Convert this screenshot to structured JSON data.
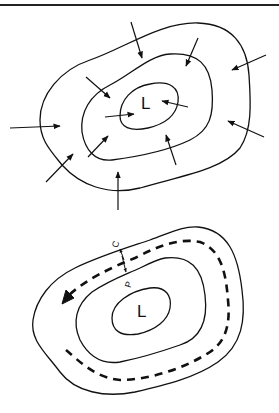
{
  "figure": {
    "top_panel": {
      "description": "Isobars around low pressure center with converging wind arrows",
      "center_label": "L",
      "isobar_count": 3,
      "arrow_count": 13
    },
    "bottom_panel": {
      "description": "Isobars around low pressure center with dashed counterclockwise flow and force arrows",
      "center_label": "L",
      "isobar_count": 3,
      "force_labels": [
        "C",
        "P"
      ]
    },
    "colors": {
      "line": "#111111",
      "background": "#ffffff"
    }
  }
}
